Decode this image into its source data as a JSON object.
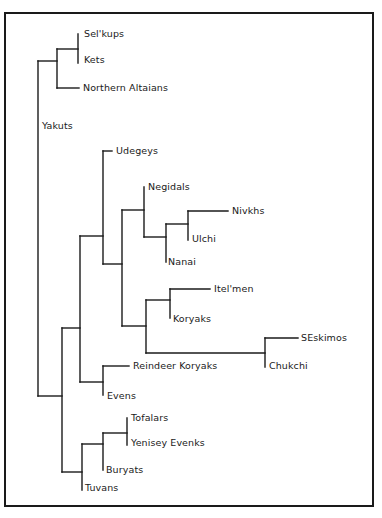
{
  "diagram": {
    "type": "phylogenetic-tree",
    "line_color": "#1a1a1a",
    "taxa": [
      {
        "name": "Sel'kups",
        "x": 84,
        "y": 34
      },
      {
        "name": "Kets",
        "x": 84,
        "y": 60
      },
      {
        "name": "Northern Altaians",
        "x": 83,
        "y": 88
      },
      {
        "name": "Yakuts",
        "x": 42,
        "y": 126
      },
      {
        "name": "Udegeys",
        "x": 116,
        "y": 151
      },
      {
        "name": "Negidals",
        "x": 148,
        "y": 187
      },
      {
        "name": "Nivkhs",
        "x": 232,
        "y": 211
      },
      {
        "name": "Ulchi",
        "x": 192,
        "y": 239
      },
      {
        "name": "Nanai",
        "x": 168,
        "y": 262
      },
      {
        "name": "Itel'men",
        "x": 214,
        "y": 289
      },
      {
        "name": "Koryaks",
        "x": 173,
        "y": 319
      },
      {
        "name": "SEskimos",
        "x": 301,
        "y": 338
      },
      {
        "name": "Chukchi",
        "x": 269,
        "y": 366
      },
      {
        "name": "Reindeer Koryaks",
        "x": 133,
        "y": 366
      },
      {
        "name": "Evens",
        "x": 107,
        "y": 396
      },
      {
        "name": "Tofalars",
        "x": 131,
        "y": 418
      },
      {
        "name": "Yenisey Evenks",
        "x": 131,
        "y": 443
      },
      {
        "name": "Buryats",
        "x": 106,
        "y": 470
      },
      {
        "name": "Tuvans",
        "x": 85,
        "y": 488
      }
    ],
    "segments": [
      [
        78,
        34,
        78,
        63
      ],
      [
        57,
        49,
        78,
        49
      ],
      [
        57,
        49,
        57,
        88
      ],
      [
        57,
        88,
        79,
        88
      ],
      [
        38,
        61,
        57,
        61
      ],
      [
        38,
        61,
        38,
        396
      ],
      [
        103,
        151,
        112,
        151
      ],
      [
        103,
        151,
        103,
        264
      ],
      [
        80,
        236,
        103,
        236
      ],
      [
        103,
        264,
        122,
        264
      ],
      [
        122,
        210,
        122,
        326
      ],
      [
        122,
        210,
        144,
        210
      ],
      [
        144,
        187,
        144,
        237
      ],
      [
        144,
        237,
        166,
        237
      ],
      [
        166,
        224,
        166,
        262
      ],
      [
        166,
        224,
        188,
        224
      ],
      [
        188,
        211,
        188,
        240
      ],
      [
        188,
        211,
        228,
        211
      ],
      [
        122,
        326,
        146,
        326
      ],
      [
        146,
        300,
        146,
        353
      ],
      [
        146,
        300,
        170,
        300
      ],
      [
        170,
        289,
        170,
        318
      ],
      [
        170,
        289,
        210,
        289
      ],
      [
        146,
        353,
        265,
        353
      ],
      [
        265,
        338,
        265,
        367
      ],
      [
        265,
        338,
        298,
        338
      ],
      [
        62,
        328,
        80,
        328
      ],
      [
        80,
        236,
        80,
        382
      ],
      [
        80,
        382,
        103,
        382
      ],
      [
        103,
        366,
        103,
        395
      ],
      [
        103,
        366,
        129,
        366
      ],
      [
        38,
        396,
        62,
        396
      ],
      [
        62,
        328,
        62,
        472
      ],
      [
        62,
        472,
        82,
        472
      ],
      [
        82,
        444,
        82,
        490
      ],
      [
        82,
        444,
        103,
        444
      ],
      [
        103,
        433,
        103,
        470
      ],
      [
        103,
        433,
        127,
        433
      ],
      [
        127,
        418,
        127,
        445
      ]
    ]
  }
}
